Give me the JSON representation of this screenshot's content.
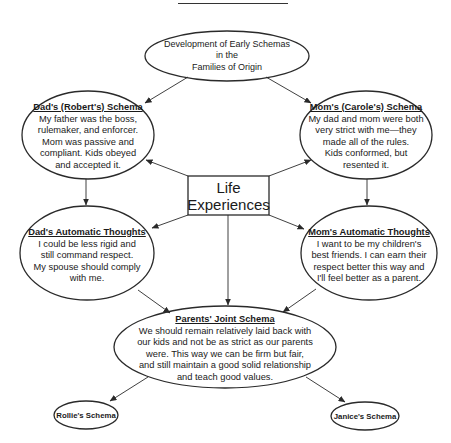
{
  "diagram": {
    "root": {
      "lines": [
        "Development of Early Schemas",
        "in the",
        "Families of Origin"
      ]
    },
    "dad_schema": {
      "title": "Dad's (Robert's) Schema",
      "lines": [
        "My father was the boss,",
        "rulemaker, and enforcer.",
        "Mom was passive and",
        "compliant. Kids obeyed",
        "and accepted it."
      ]
    },
    "mom_schema": {
      "title": "Mom's (Carole's) Schema",
      "lines": [
        "My dad and mom were both",
        "very strict with me—they",
        "made all of the rules.",
        "Kids conformed, but",
        "resented it."
      ]
    },
    "life_experiences": {
      "lines": [
        "Life",
        "Experiences"
      ]
    },
    "dad_thoughts": {
      "title": "Dad's Automatic Thoughts",
      "lines": [
        "I could be less rigid and",
        "still command respect.",
        "My spouse should comply",
        "with me."
      ]
    },
    "mom_thoughts": {
      "title": "Mom's Automatic Thoughts",
      "lines": [
        "I want to be my children's",
        "best friends. I can earn their",
        "respect better this way and",
        "I'll feel better as a parent."
      ]
    },
    "joint_schema": {
      "title": "Parents' Joint Schema",
      "lines": [
        "We should remain relatively laid back with",
        "our kids and not be as strict as our parents",
        "were. This way we can be firm but fair,",
        "and still maintain a good solid relationship",
        "and teach good values."
      ]
    },
    "rollie_schema": {
      "label": "Rollie's Schema"
    },
    "janice_schema": {
      "label": "Janice's Schema"
    }
  },
  "colors": {
    "stroke": "#2a2a2a",
    "text": "#1a1a1a",
    "background": "#ffffff"
  }
}
